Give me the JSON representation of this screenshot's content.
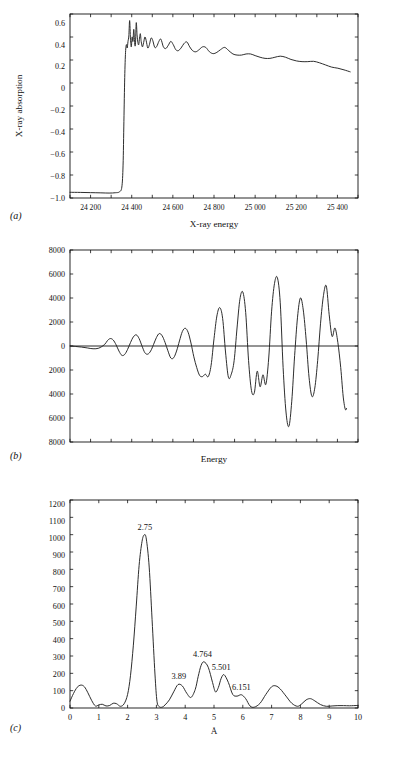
{
  "figure": {
    "panels": [
      {
        "tag": "(a)"
      },
      {
        "tag": "(b)"
      },
      {
        "tag": "(c)"
      }
    ]
  },
  "panel_a": {
    "tag": "(a)",
    "xlabel": "X-ray energy",
    "ylabel": "X-ray absorption",
    "xticks": [
      "24 200",
      "24 400",
      "24 600",
      "24 800",
      "25 000",
      "25 200",
      "25 400"
    ],
    "yticks": [
      "0.6",
      "0.4",
      "0.2",
      "0",
      "−0.2",
      "−0.4",
      "−0.6",
      "−0.8",
      "−1.0"
    ]
  },
  "panel_b": {
    "tag": "(b)",
    "xlabel": "Energy",
    "ylabel": "",
    "yticks": [
      "8000",
      "6000",
      "4000",
      "2000",
      "0",
      "2000",
      "4000",
      "6000",
      "8000"
    ]
  },
  "panel_c": {
    "tag": "(c)",
    "xlabel": "Å",
    "ylabel": "",
    "xticks": [
      "0",
      "1",
      "2",
      "3",
      "4",
      "5",
      "6",
      "7",
      "8",
      "9",
      "10"
    ],
    "yticks": [
      "1200",
      "1100",
      "1000",
      "900",
      "800",
      "700",
      "600",
      "500",
      "400",
      "300",
      "200",
      "100",
      "0"
    ],
    "peak_labels": [
      "2.75",
      "3.89",
      "4.764",
      "5.501",
      "6.151"
    ]
  },
  "chart_data": [
    {
      "type": "line",
      "panel": "a",
      "title": "",
      "xlabel": "X-ray energy",
      "ylabel": "X-ray absorption",
      "xlim": [
        24100,
        25500
      ],
      "ylim": [
        -1.0,
        0.68
      ],
      "xticks": [
        24200,
        24400,
        24600,
        24800,
        25000,
        25200,
        25400
      ],
      "yticks": [
        -1.0,
        -0.8,
        -0.6,
        -0.4,
        -0.2,
        0,
        0.2,
        0.4,
        0.6
      ],
      "grid": false,
      "legend": "none",
      "series": [
        {
          "name": "X-ray absorption spectrum",
          "x": [
            24100,
            24150,
            24200,
            24250,
            24290,
            24320,
            24340,
            24352,
            24358,
            24362,
            24366,
            24370,
            24374,
            24378,
            24382,
            24386,
            24390,
            24394,
            24398,
            24402,
            24406,
            24410,
            24414,
            24418,
            24422,
            24426,
            24430,
            24434,
            24438,
            24442,
            24446,
            24452,
            24458,
            24464,
            24470,
            24478,
            24486,
            24494,
            24502,
            24512,
            24522,
            24532,
            24542,
            24554,
            24566,
            24578,
            24590,
            24602,
            24614,
            24626,
            24640,
            24654,
            24668,
            24682,
            24696,
            24712,
            24728,
            24744,
            24760,
            24778,
            24796,
            24814,
            24832,
            24852,
            24872,
            24892,
            24912,
            24934,
            24956,
            24978,
            25000,
            25024,
            25048,
            25072,
            25096,
            25122,
            25148,
            25174,
            25200,
            25228,
            25256,
            25284,
            25312,
            25342,
            25372,
            25402,
            25432,
            25462
          ],
          "y": [
            -0.948,
            -0.949,
            -0.951,
            -0.953,
            -0.955,
            -0.952,
            -0.944,
            -0.9,
            -0.7,
            -0.3,
            0.1,
            0.33,
            0.4,
            0.37,
            0.43,
            0.48,
            0.62,
            0.45,
            0.38,
            0.47,
            0.43,
            0.54,
            0.42,
            0.4,
            0.6,
            0.49,
            0.42,
            0.4,
            0.46,
            0.5,
            0.43,
            0.38,
            0.42,
            0.47,
            0.44,
            0.37,
            0.4,
            0.46,
            0.44,
            0.375,
            0.385,
            0.43,
            0.45,
            0.38,
            0.365,
            0.395,
            0.43,
            0.4,
            0.355,
            0.345,
            0.37,
            0.41,
            0.425,
            0.38,
            0.345,
            0.335,
            0.355,
            0.38,
            0.375,
            0.335,
            0.318,
            0.33,
            0.355,
            0.375,
            0.345,
            0.315,
            0.305,
            0.305,
            0.315,
            0.315,
            0.3,
            0.285,
            0.275,
            0.275,
            0.285,
            0.295,
            0.285,
            0.265,
            0.252,
            0.245,
            0.245,
            0.248,
            0.235,
            0.215,
            0.195,
            0.185,
            0.17,
            0.152
          ]
        }
      ]
    },
    {
      "type": "line",
      "panel": "b",
      "title": "",
      "xlabel": "Energy",
      "ylabel": "",
      "xlim": [
        0,
        100
      ],
      "ylim": [
        -8000,
        8000
      ],
      "yticks": [
        -8000,
        -6000,
        -4000,
        -2000,
        0,
        2000,
        4000,
        6000,
        8000
      ],
      "grid": false,
      "legend": "none",
      "series": [
        {
          "name": "EXAFS oscillation (k-weighted)",
          "x": [
            0,
            2,
            4,
            6,
            8,
            10,
            12,
            13,
            14,
            15,
            16,
            17,
            18,
            19,
            20,
            21,
            22,
            23,
            24,
            25,
            26,
            27,
            28,
            29,
            30,
            31,
            32,
            33,
            34,
            35,
            36,
            37,
            38,
            39,
            40,
            41,
            42,
            43,
            44,
            45,
            46,
            47,
            48,
            49,
            50,
            51,
            52,
            53,
            54,
            55,
            56,
            57,
            58,
            59,
            60,
            61,
            62,
            63,
            64,
            65,
            66,
            67,
            68,
            69,
            70,
            71,
            72,
            73,
            74,
            75,
            76,
            77,
            78,
            79,
            80,
            81,
            82,
            83,
            84,
            85,
            86,
            87,
            88,
            89,
            90,
            91,
            92,
            93,
            94,
            95,
            96,
            97,
            98,
            99,
            100
          ],
          "y": [
            0,
            -40,
            -90,
            -160,
            -230,
            -180,
            120,
            450,
            620,
            500,
            100,
            -420,
            -780,
            -700,
            -280,
            280,
            760,
            930,
            620,
            0,
            -560,
            -680,
            -420,
            120,
            700,
            1040,
            850,
            300,
            -400,
            -1000,
            -980,
            -420,
            420,
            1200,
            1480,
            1150,
            250,
            -900,
            -1800,
            -2450,
            -2550,
            -2350,
            -2550,
            -1600,
            600,
            2500,
            3200,
            2300,
            -500,
            -2600,
            -2350,
            -1200,
            1500,
            3900,
            4500,
            2800,
            -1200,
            -3700,
            -3900,
            -2100,
            -3400,
            -2400,
            -3200,
            -1000,
            2900,
            5200,
            5700,
            3600,
            -1800,
            -5500,
            -6700,
            -4600,
            -800,
            2400,
            4000,
            3000,
            500,
            -2600,
            -4200,
            -3500,
            -1200,
            1900,
            4200,
            5000,
            2600,
            800,
            1500,
            300,
            -1800,
            -4500,
            -5200,
            -2000
          ]
        }
      ]
    },
    {
      "type": "line",
      "panel": "c",
      "title": "",
      "xlabel": "Å",
      "ylabel": "",
      "xlim": [
        0,
        10
      ],
      "ylim": [
        0,
        1225
      ],
      "xticks": [
        0,
        1,
        2,
        3,
        4,
        5,
        6,
        7,
        8,
        9,
        10
      ],
      "yticks": [
        0,
        100,
        200,
        300,
        400,
        500,
        600,
        700,
        800,
        900,
        1000,
        1100,
        1200
      ],
      "grid": false,
      "legend": "none",
      "annotations": [
        {
          "text": "2.75",
          "x": 2.6,
          "y": 1020
        },
        {
          "text": "3.89",
          "x": 3.78,
          "y": 140
        },
        {
          "text": "4.764",
          "x": 4.6,
          "y": 272
        },
        {
          "text": "5.501",
          "x": 5.25,
          "y": 196
        },
        {
          "text": "6.151",
          "x": 5.95,
          "y": 75
        }
      ],
      "series": [
        {
          "name": "Fourier transform magnitude",
          "x": [
            0.0,
            0.12,
            0.25,
            0.38,
            0.5,
            0.62,
            0.75,
            0.88,
            1.0,
            1.12,
            1.25,
            1.38,
            1.5,
            1.62,
            1.75,
            1.88,
            2.0,
            2.1,
            2.2,
            2.3,
            2.4,
            2.5,
            2.58,
            2.65,
            2.75,
            2.85,
            2.95,
            3.02,
            3.1,
            3.2,
            3.3,
            3.45,
            3.6,
            3.75,
            3.9,
            4.05,
            4.2,
            4.35,
            4.45,
            4.55,
            4.65,
            4.8,
            4.95,
            5.05,
            5.15,
            5.25,
            5.35,
            5.5,
            5.65,
            5.8,
            5.95,
            6.1,
            6.25,
            6.4,
            6.6,
            6.8,
            7.0,
            7.15,
            7.3,
            7.5,
            7.7,
            7.9,
            8.05,
            8.2,
            8.35,
            8.5,
            8.7,
            8.9,
            9.1,
            9.3,
            9.5,
            9.7,
            9.85,
            10.0
          ],
          "y": [
            40,
            85,
            122,
            135,
            125,
            90,
            45,
            12,
            18,
            22,
            12,
            15,
            28,
            25,
            10,
            25,
            80,
            190,
            370,
            600,
            840,
            980,
            1020,
            995,
            830,
            520,
            200,
            40,
            8,
            5,
            18,
            48,
            95,
            138,
            130,
            88,
            62,
            110,
            185,
            250,
            272,
            240,
            150,
            95,
            120,
            175,
            196,
            150,
            80,
            70,
            78,
            55,
            12,
            5,
            28,
            80,
            125,
            130,
            112,
            70,
            28,
            10,
            25,
            48,
            55,
            42,
            20,
            10,
            12,
            14,
            14,
            13,
            14,
            15
          ]
        }
      ]
    }
  ]
}
